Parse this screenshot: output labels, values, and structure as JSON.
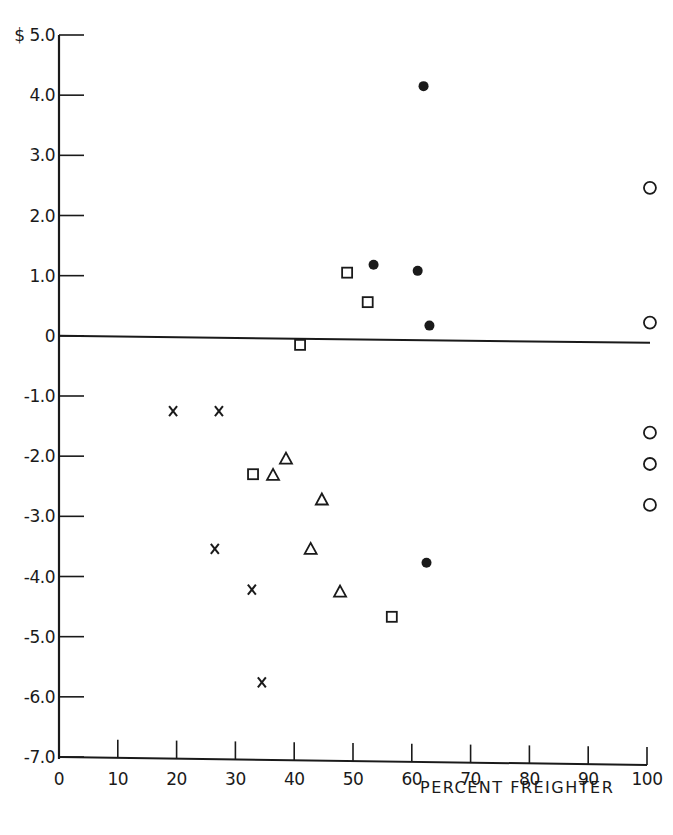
{
  "chart_data": {
    "type": "scatter",
    "title": "",
    "xlabel": "PERCENT FREIGHTER",
    "ylabel": "",
    "xlim": [
      0,
      100
    ],
    "ylim": [
      -7.0,
      5.0
    ],
    "grid": false,
    "legend": null,
    "reference_line": {
      "y": 0,
      "x_from": 0,
      "x_to": 100
    },
    "x_ticks": [
      {
        "value": 0,
        "label": "0"
      },
      {
        "value": 10,
        "label": "10"
      },
      {
        "value": 20,
        "label": "20"
      },
      {
        "value": 30,
        "label": "30"
      },
      {
        "value": 40,
        "label": "40"
      },
      {
        "value": 50,
        "label": "50"
      },
      {
        "value": 60,
        "label": "60"
      },
      {
        "value": 70,
        "label": "70"
      },
      {
        "value": 80,
        "label": "80"
      },
      {
        "value": 90,
        "label": "90"
      },
      {
        "value": 100,
        "label": "100"
      }
    ],
    "y_ticks": [
      {
        "value": 5.0,
        "label": "$ 5.0"
      },
      {
        "value": 4.0,
        "label": "4.0"
      },
      {
        "value": 3.0,
        "label": "3.0"
      },
      {
        "value": 2.0,
        "label": "2.0"
      },
      {
        "value": 1.0,
        "label": "1.0"
      },
      {
        "value": 0,
        "label": "0"
      },
      {
        "value": -1.0,
        "label": "-1.0"
      },
      {
        "value": -2.0,
        "label": "-2.0"
      },
      {
        "value": -3.0,
        "label": "-3.0"
      },
      {
        "value": -4.0,
        "label": "-4.0"
      },
      {
        "value": -5.0,
        "label": "-5.0"
      },
      {
        "value": -6.0,
        "label": "-6.0"
      },
      {
        "value": -7.0,
        "label": "-7.0"
      }
    ],
    "series": [
      {
        "name": "filled-circle",
        "marker": "filled-circle",
        "points": [
          {
            "x": 62,
            "y": 4.15
          },
          {
            "x": 53.5,
            "y": 1.18
          },
          {
            "x": 61,
            "y": 1.08
          },
          {
            "x": 63,
            "y": 0.17
          },
          {
            "x": 62.5,
            "y": -3.77
          }
        ]
      },
      {
        "name": "square",
        "marker": "open-square",
        "points": [
          {
            "x": 49,
            "y": 1.05
          },
          {
            "x": 52.5,
            "y": 0.56
          },
          {
            "x": 41,
            "y": -0.15
          },
          {
            "x": 33,
            "y": -2.3
          },
          {
            "x": 56.6,
            "y": -4.67
          }
        ]
      },
      {
        "name": "open-circle",
        "marker": "open-circle",
        "points": [
          {
            "x": 100.5,
            "y": 2.46
          },
          {
            "x": 100.5,
            "y": 0.22
          },
          {
            "x": 100.5,
            "y": -1.61
          },
          {
            "x": 100.5,
            "y": -2.13
          },
          {
            "x": 100.5,
            "y": -2.81
          }
        ]
      },
      {
        "name": "cross",
        "marker": "x",
        "points": [
          {
            "x": 19.4,
            "y": -1.25
          },
          {
            "x": 27.2,
            "y": -1.25
          },
          {
            "x": 26.5,
            "y": -3.54
          },
          {
            "x": 32.8,
            "y": -4.22
          },
          {
            "x": 34.5,
            "y": -5.76
          }
        ]
      },
      {
        "name": "triangle",
        "marker": "open-triangle",
        "points": [
          {
            "x": 38.6,
            "y": -2.04
          },
          {
            "x": 36.4,
            "y": -2.31
          },
          {
            "x": 44.7,
            "y": -2.72
          },
          {
            "x": 42.8,
            "y": -3.54
          },
          {
            "x": 47.8,
            "y": -4.25
          }
        ]
      }
    ]
  },
  "style": {
    "ink_color": "#1a1a1a",
    "background": "#ffffff"
  }
}
